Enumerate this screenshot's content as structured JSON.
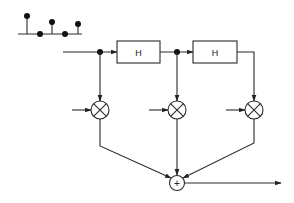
{
  "diagram": {
    "type": "FIR transversal filter (tapped delay line)",
    "input_sequence": {
      "samples": [
        {
          "x": 27,
          "top": 16
        },
        {
          "x": 40,
          "top": 34
        },
        {
          "x": 52,
          "top": 22
        },
        {
          "x": 65,
          "top": 34
        },
        {
          "x": 78,
          "top": 24
        }
      ]
    },
    "blocks": [
      {
        "id": "delay-1",
        "label": "H"
      },
      {
        "id": "delay-2",
        "label": "H"
      }
    ],
    "multipliers": [
      {
        "id": "mult-1",
        "symbol": "×"
      },
      {
        "id": "mult-2",
        "symbol": "×"
      },
      {
        "id": "mult-3",
        "symbol": "×"
      }
    ],
    "summer": {
      "symbol": "+"
    },
    "colors": {
      "line": "#2a2a2a",
      "background": "#ffffff"
    }
  }
}
